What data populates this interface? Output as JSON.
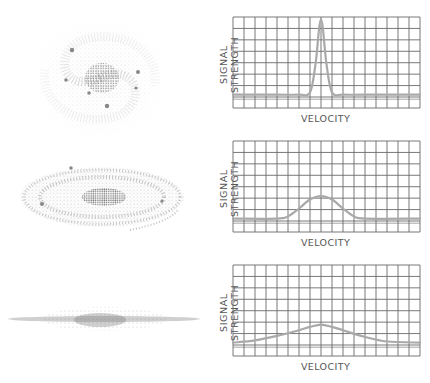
{
  "figure": {
    "colors": {
      "grid": "#6a6a6a",
      "curve": "#a9a9a9",
      "galaxy": "#8a8a8a",
      "text": "#555555"
    },
    "rows": [
      {
        "galaxy": {
          "name": "face-on spiral galaxy",
          "orientation": "face-on"
        },
        "chart": {
          "ylabel": "SIGNAL STRENGTH",
          "xlabel": "VELOCITY",
          "line_profile": "narrow"
        }
      },
      {
        "galaxy": {
          "name": "inclined spiral galaxy",
          "orientation": "inclined"
        },
        "chart": {
          "ylabel": "SIGNAL STRENGTH",
          "xlabel": "VELOCITY",
          "line_profile": "medium"
        }
      },
      {
        "galaxy": {
          "name": "edge-on spiral galaxy",
          "orientation": "edge-on"
        },
        "chart": {
          "ylabel": "SIGNAL STRENGTH",
          "xlabel": "VELOCITY",
          "line_profile": "broad"
        }
      }
    ],
    "caption": ""
  },
  "chart_data": [
    {
      "type": "line",
      "title": "",
      "xlabel": "VELOCITY",
      "ylabel": "SIGNAL STRENGTH",
      "grid": true,
      "grid_columns": 17,
      "grid_rows": 8,
      "x": [
        0,
        4,
        6,
        7,
        7.5,
        8,
        8.5,
        9,
        10,
        12,
        17
      ],
      "values": [
        0.3,
        0.3,
        0.3,
        0.5,
        3.0,
        7.0,
        3.0,
        0.5,
        0.3,
        0.3,
        0.3
      ],
      "xlim": [
        0,
        17
      ],
      "ylim": [
        0,
        8
      ]
    },
    {
      "type": "line",
      "title": "",
      "xlabel": "VELOCITY",
      "ylabel": "SIGNAL STRENGTH",
      "grid": true,
      "grid_columns": 17,
      "grid_rows": 8,
      "x": [
        0,
        4,
        5,
        6,
        7,
        8,
        9,
        10,
        11,
        12,
        17
      ],
      "values": [
        0.3,
        0.3,
        0.5,
        1.2,
        2.0,
        2.3,
        2.0,
        1.2,
        0.5,
        0.3,
        0.3
      ],
      "xlim": [
        0,
        17
      ],
      "ylim": [
        0,
        8
      ]
    },
    {
      "type": "line",
      "title": "",
      "xlabel": "VELOCITY",
      "ylabel": "SIGNAL STRENGTH",
      "grid": true,
      "grid_columns": 17,
      "grid_rows": 8,
      "x": [
        0,
        2,
        4,
        6,
        7,
        8,
        9,
        10,
        12,
        14,
        17
      ],
      "values": [
        0.3,
        0.5,
        0.9,
        1.4,
        1.7,
        1.9,
        1.7,
        1.4,
        0.8,
        0.4,
        0.3
      ],
      "xlim": [
        0,
        17
      ],
      "ylim": [
        0,
        8
      ]
    }
  ]
}
